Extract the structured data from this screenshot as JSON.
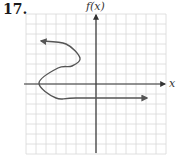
{
  "problem": {
    "number": "17."
  },
  "chart_data": {
    "type": "line",
    "title": "",
    "xlabel": "x",
    "ylabel": "f(x)",
    "xlim": [
      -7,
      7
    ],
    "ylim": [
      -7,
      7
    ],
    "grid": true,
    "grid_spacing": 1,
    "tick_labels": false,
    "series": [
      {
        "name": "curve",
        "description": "S-shaped curve (not a function) starting with left arrow, bulging right, looping back left across the x-axis, then horizontal ray to the right",
        "points": [
          {
            "x": -5.5,
            "y": 4.3,
            "arrow": "start"
          },
          {
            "x": -3.0,
            "y": 4.0
          },
          {
            "x": -1.6,
            "y": 2.6
          },
          {
            "x": -2.4,
            "y": 1.8
          },
          {
            "x": -3.8,
            "y": 1.6
          },
          {
            "x": -5.7,
            "y": 0.1
          },
          {
            "x": -4.0,
            "y": -1.4
          },
          {
            "x": -2.0,
            "y": -1.4
          },
          {
            "x": 5.1,
            "y": -1.4,
            "arrow": "end"
          }
        ]
      }
    ]
  },
  "colors": {
    "grid": "#d8d8d8",
    "axis": "#333333",
    "curve": "#555555"
  }
}
